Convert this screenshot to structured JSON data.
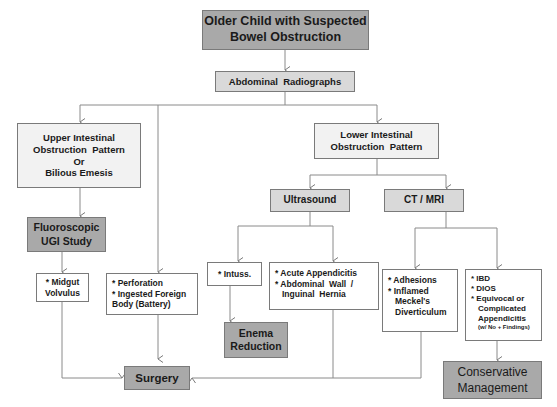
{
  "diagram": {
    "title": [
      "Older Child with Suspected",
      "Bowel Obstruction"
    ],
    "radiographs": "Abdominal  Radiographs",
    "upper_pattern": [
      "Upper Intestinal",
      "Obstruction  Pattern",
      "Or",
      "Bilious Emesis"
    ],
    "lower_pattern": [
      "Lower Intestinal",
      "Obstruction  Pattern"
    ],
    "fluoroscopic": [
      "Fluoroscopic",
      "UGI Study"
    ],
    "ultrasound": "Ultrasound",
    "ct_mri": "CT / MRI",
    "midgut": [
      "* Midgut",
      "Volvulus"
    ],
    "perforation": [
      "* Perforation",
      "* Ingested Foreign",
      "Body (Battery)"
    ],
    "intuss": "* Intuss.",
    "acute": [
      "* Acute Appendicitis",
      "* Abdominal  Wall  /",
      "Inguinal  Hernia"
    ],
    "adhesions": [
      "* Adhesions",
      "* Inflamed",
      "Meckel's",
      "Diverticulum"
    ],
    "ibd": [
      "* IBD",
      "* DIOS",
      "* Equivocal or",
      "Complicated",
      "Appendicitis",
      "(w/ No + Findings)"
    ],
    "enema": [
      "Enema",
      "Reduction"
    ],
    "surgery": "Surgery",
    "conservative": [
      "Conservative",
      "Management"
    ]
  },
  "colors": {
    "dark_box": "#a9a9a9",
    "mid_box": "#d9d9d9",
    "light_box": "#f2f2f2",
    "line": "#7a7a7a"
  }
}
